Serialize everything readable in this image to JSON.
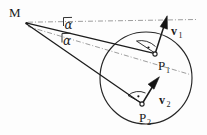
{
  "figure": {
    "background_color": "#fdfdfd",
    "ink_color": "#1c1c1c",
    "guide_color": "#8b8b8b",
    "labels": {
      "m_point": "M",
      "p1_point": "P",
      "p1_sub": "1",
      "p2_point": "P",
      "p2_sub": "2",
      "v1_vector": "v",
      "v1_sub": "1",
      "v2_vector": "v",
      "v2_sub": "2",
      "alpha_upper": "α",
      "alpha_lower": "α"
    },
    "geometry": {
      "vertex_m": {
        "x": 26,
        "y": 23
      },
      "circle": {
        "cx": 146,
        "cy": 78,
        "r": 46
      },
      "p1": {
        "x": 155,
        "y": 54
      },
      "p2": {
        "x": 142,
        "y": 104
      },
      "v1_tip": {
        "x": 167,
        "y": 16
      },
      "v2_tip": {
        "x": 159,
        "y": 77
      },
      "guide_upper_end": {
        "x": 196,
        "y": 20
      },
      "guide_lower_end": {
        "x": 190,
        "y": 74
      },
      "angle_upper_degrees": "α",
      "angle_lower_degrees": "α"
    },
    "elements": {
      "right_angle_p1": "right-angle-marker",
      "right_angle_p2": "right-angle-marker",
      "sight_line_1": "M to P1",
      "sight_line_2": "M to P2",
      "reference_line_1": "horizontal dash-dot through M",
      "reference_line_2": "dash-dot through M and circle center"
    }
  }
}
